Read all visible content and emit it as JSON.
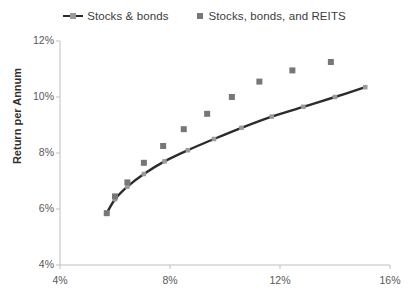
{
  "chart_data": {
    "type": "scatter",
    "title": "",
    "subtitle": "",
    "xlabel": "",
    "ylabel": "Return per Annum",
    "xlim": [
      4,
      16
    ],
    "ylim": [
      4,
      12
    ],
    "x_tick_labels": [
      "4%",
      "8%",
      "12%",
      "16%"
    ],
    "x_ticks": [
      4,
      8,
      12,
      16
    ],
    "y_tick_labels": [
      "4%",
      "6%",
      "8%",
      "10%",
      "12%"
    ],
    "y_ticks": [
      4,
      6,
      8,
      10,
      12
    ],
    "grid": false,
    "legend_position": "top",
    "series": [
      {
        "name": "Stocks & bonds",
        "style": "line-with-markers",
        "line_color": "#2b2b2b",
        "marker_color": "#9a9a9a",
        "x": [
          5.7,
          6.0,
          6.45,
          7.05,
          7.8,
          8.65,
          9.6,
          10.6,
          11.7,
          12.85,
          14.0,
          15.1
        ],
        "y": [
          5.85,
          6.35,
          6.8,
          7.25,
          7.7,
          8.1,
          8.5,
          8.9,
          9.3,
          9.65,
          10.0,
          10.35
        ]
      },
      {
        "name": "Stocks, bonds, and REITS",
        "style": "markers",
        "marker_color": "#777777",
        "x": [
          5.7,
          6.0,
          6.45,
          7.05,
          7.75,
          8.5,
          9.35,
          10.25,
          11.25,
          12.45,
          13.85
        ],
        "y": [
          5.85,
          6.45,
          6.95,
          7.65,
          8.25,
          8.85,
          9.4,
          10.0,
          10.55,
          10.95,
          11.25
        ]
      }
    ]
  },
  "legend": {
    "items": [
      {
        "label": "Stocks & bonds",
        "key": "line-marker-key-icon"
      },
      {
        "label": "Stocks, bonds, and REITS",
        "key": "square-marker-key-icon"
      }
    ]
  },
  "axes": {
    "y_title": "Return per Annum",
    "y_labels": [
      "12%",
      "10%",
      "8%",
      "6%",
      "4%"
    ],
    "x_labels": [
      "4%",
      "8%",
      "12%",
      "16%"
    ]
  },
  "colors": {
    "line": "#2b2b2b",
    "line_marker": "#9a9a9a",
    "reits_marker": "#777777",
    "axis": "#bfbfbf",
    "text": "#585858",
    "title_text": "#2f2f2f"
  }
}
